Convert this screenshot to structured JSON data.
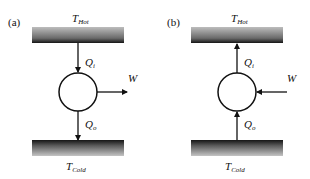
{
  "panels": [
    {
      "tag": "(a)",
      "hot": {
        "T": "T",
        "sub": "Hot"
      },
      "cold": {
        "T": "T",
        "sub": "Cold"
      },
      "qi": {
        "Q": "Q",
        "sub": "i"
      },
      "qo": {
        "Q": "Q",
        "sub": "o"
      },
      "work": "W",
      "direction": "heat-engine"
    },
    {
      "tag": "(b)",
      "hot": {
        "T": "T",
        "sub": "Hot"
      },
      "cold": {
        "T": "T",
        "sub": "Cold"
      },
      "qi": {
        "Q": "Q",
        "sub": "i"
      },
      "qo": {
        "Q": "Q",
        "sub": "o"
      },
      "work": "W",
      "direction": "heat-pump"
    }
  ]
}
